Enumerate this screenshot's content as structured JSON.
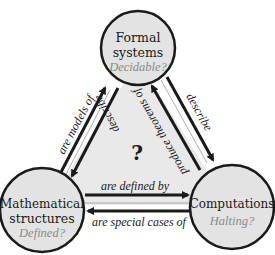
{
  "diagram": {
    "center_label": "?",
    "nodes": [
      {
        "id": "formal",
        "title_lines": [
          "Formal",
          "systems"
        ],
        "question": "Decidable?"
      },
      {
        "id": "math",
        "title_lines": [
          "Mathematical",
          "structures"
        ],
        "question": "Defined?"
      },
      {
        "id": "comp",
        "title_lines": [
          "Computations"
        ],
        "question": "Halting?"
      }
    ],
    "edges": [
      {
        "from": "math",
        "to": "formal",
        "label": "are models of"
      },
      {
        "from": "formal",
        "to": "math",
        "label": "describe"
      },
      {
        "from": "formal",
        "to": "comp",
        "label": "describe"
      },
      {
        "from": "comp",
        "to": "formal",
        "label": "produce theorems of"
      },
      {
        "from": "math",
        "to": "comp",
        "label": "are defined by"
      },
      {
        "from": "comp",
        "to": "math",
        "label": "are special cases of"
      }
    ]
  },
  "colors": {
    "node_fill": "#e3e3e3",
    "triangle_fill": "#e9e9e9",
    "stroke": "#1a1a1a",
    "question_text": "#8a8a8a"
  }
}
